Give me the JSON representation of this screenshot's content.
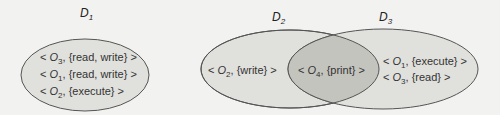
{
  "diagram": {
    "domains": [
      {
        "id": "D1",
        "label": "D",
        "subscript": "1",
        "entries": [
          {
            "object": "O",
            "sub": "3",
            "rights": "{read, write}"
          },
          {
            "object": "O",
            "sub": "1",
            "rights": "{read, write}"
          },
          {
            "object": "O",
            "sub": "2",
            "rights": "{execute}"
          }
        ]
      },
      {
        "id": "D2",
        "label": "D",
        "subscript": "2",
        "entries": [
          {
            "object": "O",
            "sub": "2",
            "rights": "{write}"
          }
        ]
      },
      {
        "id": "D3",
        "label": "D",
        "subscript": "3",
        "entries": [
          {
            "object": "O",
            "sub": "1",
            "rights": "{execute}"
          },
          {
            "object": "O",
            "sub": "3",
            "rights": "{read}"
          }
        ]
      }
    ],
    "shared": {
      "between": [
        "D2",
        "D3"
      ],
      "entries": [
        {
          "object": "O",
          "sub": "4",
          "rights": "{print}"
        }
      ]
    },
    "colors": {
      "background": "#f2f2f0",
      "domain_fill": "#e0e0dc",
      "overlap_fill": "#c4c4be",
      "stroke": "#555555"
    }
  }
}
